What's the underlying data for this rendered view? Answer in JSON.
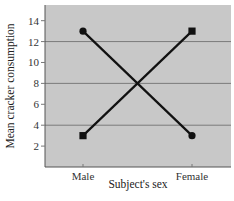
{
  "chart_data": {
    "type": "line",
    "title": "",
    "xlabel": "Subject's sex",
    "ylabel": "Mean cracker consumption",
    "categories": [
      "Male",
      "Female"
    ],
    "series": [
      {
        "name": "Series A (circle markers)",
        "marker": "circle",
        "values": [
          13,
          3
        ]
      },
      {
        "name": "Series B (square markers)",
        "marker": "square",
        "values": [
          3,
          13
        ]
      }
    ],
    "yticks": [
      2,
      4,
      6,
      8,
      10,
      12,
      14
    ],
    "ylim": [
      0,
      15.5
    ],
    "gridlines_y": [
      4,
      8,
      12
    ],
    "legend": null,
    "colors": {
      "plot_bg": "#c8c8c8",
      "grid": "#7a7a7a",
      "line": "#111111"
    }
  }
}
